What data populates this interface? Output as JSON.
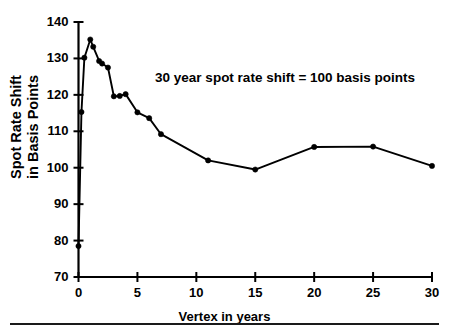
{
  "chart_data": {
    "type": "line",
    "title": "",
    "subtitle": "",
    "xlabel": "Vertex in years",
    "ylabel": "Spot Rate Shift\nin Basis Points",
    "ylabel_lines": [
      "Spot Rate Shift",
      "in Basis Points"
    ],
    "xlim": [
      0,
      30
    ],
    "ylim": [
      70,
      140
    ],
    "xticks": [
      0,
      5,
      10,
      15,
      20,
      25,
      30
    ],
    "xtick_labels": [
      "0",
      "5",
      "10",
      "15",
      "20",
      "25",
      "30"
    ],
    "yticks": [
      70,
      80,
      90,
      100,
      110,
      120,
      130,
      140
    ],
    "ytick_labels": [
      "70",
      "80",
      "90",
      "100",
      "110",
      "120",
      "130",
      "140"
    ],
    "grid": false,
    "legend": null,
    "legend_position": "none",
    "marker": "filled-circle",
    "line_color": "#000000",
    "marker_color": "#000000",
    "annotations": [
      {
        "text": "30 year spot rate shift = 100 basis points",
        "x": 12.5,
        "y": 124.5
      }
    ],
    "series": [
      {
        "name": "Spot rate shift",
        "x": [
          0.0,
          0.25,
          0.5,
          1.0,
          1.25,
          1.75,
          2.0,
          2.5,
          3.0,
          3.5,
          4.0,
          5.0,
          6.0,
          7.0,
          11.0,
          15.0,
          20.0,
          25.0,
          30.0
        ],
        "values": [
          78.5,
          115.3,
          130.2,
          135.2,
          133.2,
          129.3,
          128.6,
          127.5,
          119.6,
          119.7,
          120.2,
          115.2,
          113.6,
          109.2,
          102.0,
          99.5,
          105.7,
          105.8,
          100.5
        ]
      }
    ]
  },
  "figure": {
    "background_color": "#ffffff",
    "axis_color": "#000000",
    "bottom_rule": true
  }
}
